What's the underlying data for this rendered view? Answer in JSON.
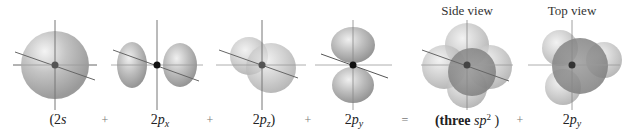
{
  "figure": {
    "colors": {
      "orbital_fill": "#b5b5b5",
      "orbital_dark": "#8a8a8a",
      "axis": "#808080",
      "nucleus_gray": "#555555",
      "nucleus_black": "#111111"
    },
    "panels": [
      {
        "id": "2s",
        "prefix": "(2",
        "main": "s",
        "sub": "",
        "suffix": ""
      },
      {
        "id": "2px",
        "prefix": "2",
        "main": "p",
        "sub": "x",
        "suffix": ""
      },
      {
        "id": "2pz",
        "prefix": "2",
        "main": "p",
        "sub": "z",
        "suffix": ")"
      },
      {
        "id": "2py",
        "prefix": "2",
        "main": "p",
        "sub": "y",
        "suffix": ""
      },
      {
        "id": "three-sp2",
        "prefix": "(three ",
        "main": "sp",
        "sup": "2",
        "suffix": " )"
      },
      {
        "id": "2py-result",
        "prefix": "2",
        "main": "p",
        "sub": "y",
        "suffix": ""
      }
    ],
    "operators": [
      "+",
      "+",
      "+",
      "=",
      "+"
    ],
    "view_labels": {
      "side": "Side view",
      "top": "Top view"
    }
  }
}
